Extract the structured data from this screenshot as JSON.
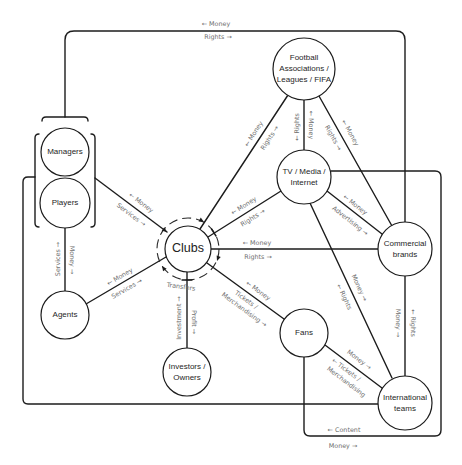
{
  "diagram": {
    "nodes": {
      "football_associations": {
        "lines": [
          "Football",
          "Associations /",
          "Leagues / FIFA"
        ]
      },
      "tv_media_internet": {
        "lines": [
          "TV / Media /",
          "Internet"
        ]
      },
      "commercial_brands": {
        "lines": [
          "Commercial",
          "brands"
        ]
      },
      "clubs": {
        "lines": [
          "Clubs"
        ],
        "cycle_label": "Transfers"
      },
      "managers": {
        "lines": [
          "Managers"
        ]
      },
      "players": {
        "lines": [
          "Players"
        ]
      },
      "agents": {
        "lines": [
          "Agents"
        ]
      },
      "investors_owners": {
        "lines": [
          "Investors /",
          "Owners"
        ]
      },
      "fans": {
        "lines": [
          "Fans"
        ]
      },
      "international_teams": {
        "lines": [
          "International",
          "teams"
        ]
      }
    },
    "flows": {
      "managers_players__commercial_loop": {
        "labels": [
          "← Money",
          "Rights →"
        ]
      },
      "managers_players__clubs": {
        "labels": [
          "← Money",
          "Services →"
        ]
      },
      "players__agents": {
        "labels": [
          "Services →",
          "Money →"
        ]
      },
      "agents__clubs": {
        "labels": [
          "← Money",
          "Services →"
        ]
      },
      "clubs__football_associations": {
        "labels": [
          "← Money",
          "Rights →"
        ]
      },
      "clubs__tv": {
        "labels": [
          "← Money",
          "Rights →"
        ]
      },
      "clubs__commercial": {
        "labels": [
          "← Money",
          "Rights →"
        ]
      },
      "clubs__fans": {
        "labels": [
          "← Money",
          "Tickets /",
          "Merchandising →"
        ]
      },
      "clubs__investors": {
        "labels": [
          "Investment →",
          "Profit →"
        ]
      },
      "football_associations__tv": {
        "labels": [
          "← Rights",
          "← Money"
        ]
      },
      "football_associations__commercial": {
        "labels": [
          "← Money",
          "Rights →"
        ]
      },
      "tv__commercial": {
        "labels": [
          "← Money",
          "Advertising →"
        ]
      },
      "tv__international": {
        "labels": [
          "Money →",
          "← Rights"
        ]
      },
      "commercial__international": {
        "labels": [
          "Money →",
          "← Rights"
        ]
      },
      "fans__international": {
        "labels": [
          "Money →",
          "← Tickets /",
          "Merchandising"
        ]
      },
      "tv_fans__international_loop": {
        "labels": [
          "← Content",
          "Money →"
        ]
      }
    },
    "colors": {
      "line": "#1c1c1c",
      "node_text": "#262626",
      "label_text": "#6e6e6e",
      "background": "#ffffff"
    }
  }
}
